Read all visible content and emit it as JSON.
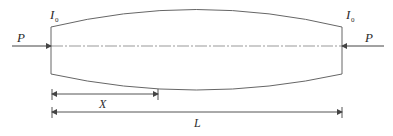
{
  "diagram": {
    "type": "tapered-column",
    "labels": {
      "inertia_left": "I",
      "inertia_left_sub": "0",
      "inertia_right": "I",
      "inertia_right_sub": "0",
      "load_left": "P",
      "load_right": "P",
      "position": "X",
      "length": "L"
    },
    "colors": {
      "line": "#555555",
      "axis": "#888888",
      "text": "#2b2b2b"
    }
  }
}
